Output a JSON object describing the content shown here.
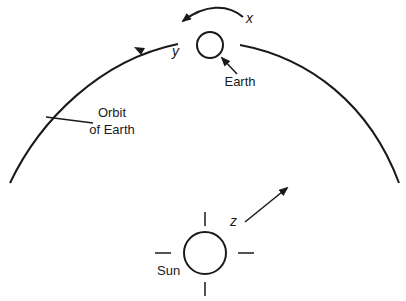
{
  "diagram": {
    "type": "orbital-motion-diagram",
    "colors": {
      "stroke": "#1a1a1a",
      "background": "#ffffff"
    },
    "labels": {
      "x_axis": "x",
      "y_axis": "y",
      "z_axis": "z",
      "earth": "Earth",
      "orbit_line1": "Orbit",
      "orbit_line2": "of Earth",
      "sun": "Sun"
    },
    "elements": [
      {
        "name": "earth",
        "shape": "circle",
        "cx": 210,
        "cy": 45,
        "r": 13
      },
      {
        "name": "sun",
        "shape": "circle",
        "cx": 205,
        "cy": 253,
        "r": 21
      },
      {
        "name": "orbit",
        "shape": "arc",
        "direction": "counterclockwise"
      },
      {
        "name": "x-rotation-arrow",
        "meaning": "Earth rotation"
      },
      {
        "name": "y-orbit-direction-arrow",
        "meaning": "direction of orbital motion"
      },
      {
        "name": "z-arrow",
        "meaning": "axis pointing away from Sun"
      }
    ]
  }
}
